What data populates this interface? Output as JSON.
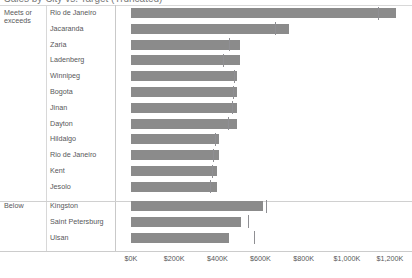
{
  "title": "Sales by City vs. Target (Truncated)",
  "axis_title_left_top": "",
  "groups": [
    {
      "label": "Meets or exceeds",
      "label_line1": "Meets or",
      "label_line2": "exceeds"
    },
    {
      "label": "Below"
    }
  ],
  "x_ticks": [
    "$0K",
    "$200K",
    "$400K",
    "$600K",
    "$800K",
    "$1,000K",
    "$1,200K"
  ],
  "colors": {
    "bar": "#8b8b8b",
    "reference_line": "#8f8f93",
    "grid": "#d0d0d0",
    "text": "#58585a"
  },
  "chart_data": {
    "type": "bar",
    "title": "Sales by City vs. Target (Truncated)",
    "orientation": "horizontal",
    "xlabel": "",
    "ylabel": "",
    "xlim": [
      0,
      1200000
    ],
    "x_tick_values": [
      0,
      200000,
      400000,
      600000,
      800000,
      1000000,
      1200000
    ],
    "x_tick_labels": [
      "$0K",
      "$200K",
      "$400K",
      "$600K",
      "$800K",
      "$1,000K",
      "$1,200K"
    ],
    "grid": false,
    "legend": "none",
    "value_unit": "USD",
    "panes": [
      {
        "name": "Meets or exceeds",
        "categories": [
          "Rio de Janeiro",
          "Jacaranda",
          "Zaria",
          "Ladenberg",
          "Winnipeg",
          "Bogota",
          "Jinan",
          "Dayton",
          "Hildalgo",
          "Rio de Janeiro",
          "Kent",
          "Jesolo"
        ],
        "series": [
          {
            "name": "Sales",
            "values": [
              1228000,
              733000,
              505000,
              505000,
              492000,
              492000,
              492000,
              492000,
              408000,
              408000,
              399000,
              399000
            ]
          },
          {
            "name": "Target",
            "type": "reference-line",
            "values": [
              1145000,
              667000,
              455000,
              427000,
              478000,
              473000,
              468000,
              450000,
              390000,
              380000,
              375000,
              368000
            ]
          }
        ]
      },
      {
        "name": "Below",
        "categories": [
          "Kingston",
          "Saint Petersburg",
          "Ulsan"
        ],
        "series": [
          {
            "name": "Sales",
            "values": [
              612000,
              510000,
              454000
            ]
          },
          {
            "name": "Target",
            "type": "reference-line",
            "values": [
              626000,
              542000,
              570000
            ]
          }
        ]
      }
    ]
  }
}
